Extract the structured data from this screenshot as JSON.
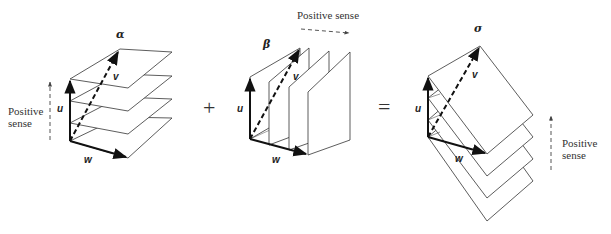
{
  "figure": {
    "left": {
      "title": "α",
      "sense_label_line1": "Positive",
      "sense_label_line2": "sense",
      "vectors": {
        "u": "u",
        "v": "v",
        "w": "w"
      },
      "plane_count": 4,
      "stack_direction": "vertical (along u)"
    },
    "operator_plus": "+",
    "middle": {
      "title": "β",
      "sense_label": "Positive sense",
      "vectors": {
        "u": "u",
        "v": "v",
        "w": "w"
      },
      "plane_count": 4,
      "stack_direction": "horizontal (along w)"
    },
    "operator_equals": "=",
    "right": {
      "title": "σ",
      "sense_label_line1": "Positive",
      "sense_label_line2": "sense",
      "vectors": {
        "u": "u",
        "v": "v",
        "w": "w"
      },
      "plane_count": 4,
      "stack_direction": "tilted planes stacked downward"
    }
  },
  "colors": {
    "line": "#222222",
    "thin_line": "#444444",
    "dashed_sense": "#555555",
    "background": "#ffffff"
  }
}
